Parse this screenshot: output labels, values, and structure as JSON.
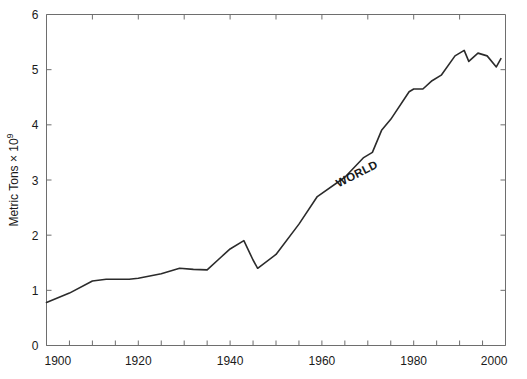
{
  "chart_data": {
    "type": "line",
    "title": "",
    "subtitle": "",
    "xlabel": "",
    "ylabel": "Metric Tons × 10",
    "ylabel_exponent": "9",
    "xlim": [
      1900,
      2000
    ],
    "ylim": [
      0,
      6
    ],
    "x_ticks_major": [
      1900,
      1920,
      1940,
      1960,
      1980,
      2000
    ],
    "x_ticks_minor_step": 5,
    "y_ticks_major": [
      0,
      1,
      2,
      3,
      4,
      5,
      6
    ],
    "x_tick_labels": [
      "1900",
      "1920",
      "1940",
      "1960",
      "1980",
      "2000"
    ],
    "y_tick_labels": [
      "0",
      "1",
      "2",
      "3",
      "4",
      "5",
      "6"
    ],
    "grid": false,
    "legend": null,
    "legend_position": "none",
    "annotations": [
      {
        "text": "WORLD",
        "x": 1968,
        "y": 3.05,
        "rotation": -27
      }
    ],
    "series": [
      {
        "name": "WORLD",
        "color": "#2b2b2b",
        "x": [
          1900,
          1905,
          1910,
          1913,
          1918,
          1920,
          1925,
          1929,
          1932,
          1935,
          1938,
          1940,
          1943,
          1945,
          1946,
          1950,
          1955,
          1959,
          1965,
          1969,
          1971,
          1973,
          1975,
          1979,
          1980,
          1982,
          1984,
          1986,
          1989,
          1991,
          1992,
          1994,
          1996,
          1998,
          1999
        ],
        "y": [
          0.78,
          0.95,
          1.17,
          1.2,
          1.2,
          1.22,
          1.3,
          1.4,
          1.38,
          1.37,
          1.6,
          1.75,
          1.9,
          1.55,
          1.4,
          1.65,
          2.2,
          2.7,
          3.05,
          3.4,
          3.5,
          3.9,
          4.1,
          4.6,
          4.65,
          4.65,
          4.8,
          4.9,
          5.25,
          5.35,
          5.15,
          5.3,
          5.25,
          5.05,
          5.2
        ]
      }
    ]
  },
  "figure": {
    "background_color": "#ffffff",
    "axis_color": "#6e6e6e",
    "line_color": "#2b2b2b",
    "width": 527,
    "height": 379
  }
}
